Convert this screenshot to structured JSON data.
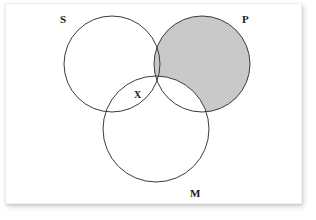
{
  "diagram": {
    "type": "venn-3-circle-syllogism",
    "background_color": "#ffffff",
    "card_color": "#ffffff",
    "stroke_color": "#3a3a3a",
    "shade_color": "#c9c9c9",
    "label_color": "#1a1a1a",
    "circles": [
      {
        "id": "S",
        "label": "S",
        "cx": 112,
        "cy": 64,
        "r": 48,
        "shaded": false
      },
      {
        "id": "P",
        "label": "P",
        "cx": 202,
        "cy": 64,
        "r": 48,
        "shaded": true
      },
      {
        "id": "M",
        "label": "M",
        "cx": 156,
        "cy": 129,
        "r": 53,
        "shaded": false
      }
    ],
    "labels": [
      {
        "id": "S",
        "text": "S",
        "x": 60,
        "y": 14
      },
      {
        "id": "P",
        "text": "P",
        "x": 242,
        "y": 14
      },
      {
        "id": "M",
        "text": "M",
        "x": 190,
        "y": 188
      }
    ],
    "marks": [
      {
        "id": "x-mark",
        "text": "X",
        "x": 134,
        "y": 90,
        "region": "S-and-M-not-P"
      }
    ],
    "shading": {
      "description": "P circle shaded except region overlapping M",
      "shaded_region": "P-minus-M",
      "fill": "#c9c9c9"
    }
  },
  "chart_data": {
    "type": "diagram",
    "title": "",
    "sets": [
      "S",
      "P",
      "M"
    ],
    "regions": [
      {
        "name": "S only",
        "shaded": false,
        "mark": ""
      },
      {
        "name": "P only",
        "shaded": true,
        "mark": ""
      },
      {
        "name": "M only",
        "shaded": false,
        "mark": ""
      },
      {
        "name": "S and P only",
        "shaded": true,
        "mark": ""
      },
      {
        "name": "S and M only",
        "shaded": false,
        "mark": "X"
      },
      {
        "name": "P and M only",
        "shaded": false,
        "mark": ""
      },
      {
        "name": "S and P and M",
        "shaded": false,
        "mark": ""
      }
    ],
    "legend": []
  }
}
